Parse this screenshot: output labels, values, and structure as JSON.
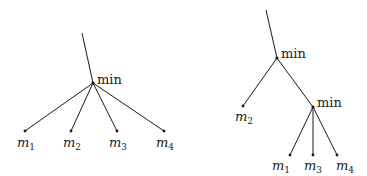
{
  "diagrams": [
    {
      "name": "flat-min-tree",
      "root": {
        "label": "min"
      },
      "leaves": [
        {
          "base": "m",
          "sub": "1"
        },
        {
          "base": "m",
          "sub": "2"
        },
        {
          "base": "m",
          "sub": "3"
        },
        {
          "base": "m",
          "sub": "4"
        }
      ]
    },
    {
      "name": "nested-min-tree",
      "root": {
        "label": "min"
      },
      "left_leaf": {
        "base": "m",
        "sub": "2"
      },
      "inner": {
        "label": "min"
      },
      "inner_leaves": [
        {
          "base": "m",
          "sub": "1"
        },
        {
          "base": "m",
          "sub": "3"
        },
        {
          "base": "m",
          "sub": "4"
        }
      ]
    }
  ]
}
